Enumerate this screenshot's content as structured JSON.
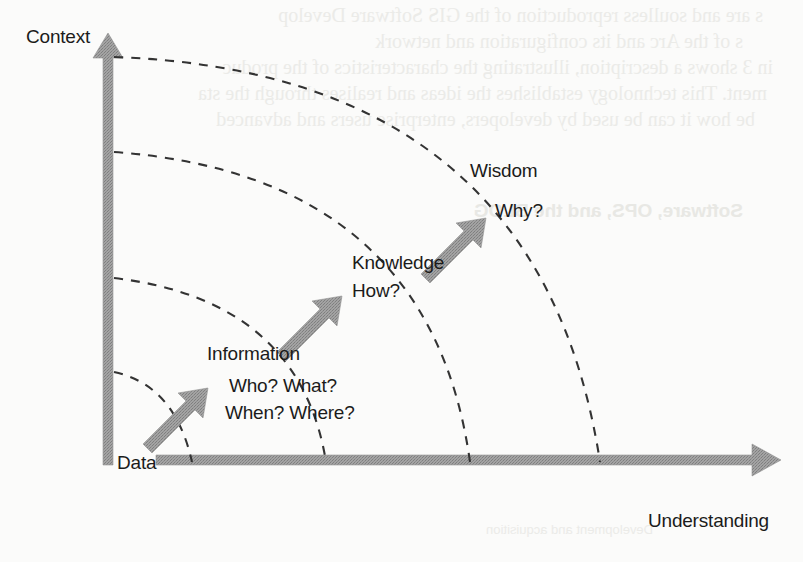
{
  "diagram": {
    "axes": {
      "y_label": "Context",
      "x_label": "Understanding",
      "origin_label": "Data"
    },
    "stages": [
      {
        "id": "data",
        "label": "Data",
        "questions": []
      },
      {
        "id": "information",
        "label": "Information",
        "questions": [
          "Who? What?",
          "When? Where?"
        ]
      },
      {
        "id": "knowledge",
        "label": "Knowledge",
        "questions": [
          "How?"
        ]
      },
      {
        "id": "wisdom",
        "label": "Wisdom",
        "questions": [
          "Why?"
        ]
      }
    ],
    "colors": {
      "arrow_gray": "#9b9b9b",
      "arrow_gray_dark": "#8d8d8d",
      "text": "#1b1b1b",
      "dash": "#3a3a3a",
      "page": "#fbfbfa",
      "bleed": "#e9e9e6"
    },
    "arc_count": 4,
    "arrow_count": 3
  },
  "bleedthrough": {
    "note": "faint mirrored show-through text from the reverse side of the scanned page",
    "lines": [
      "s are and soulless reproduction of the GIS Software Develop",
      "s of the Arc and its configuration and network",
      "in 3 shows a description, illustrating the characteristics of the produc",
      "ment. This technology establishes the ideas and realises through the sta",
      "be how it can be used by developers, enterprise users and advanced",
      "Software, OPS, and the BLOG",
      "Development and acquisition"
    ]
  }
}
